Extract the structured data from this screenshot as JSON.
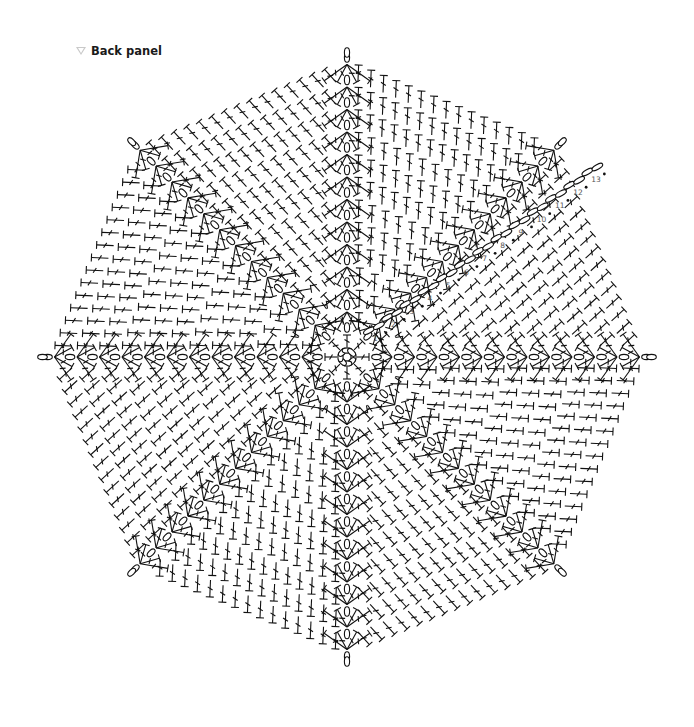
{
  "title": {
    "icon": "triangle-down-icon",
    "text": "Back panel"
  },
  "diagram": {
    "type": "crochet-chart",
    "shape": "octagon",
    "center": [
      347,
      357
    ],
    "rounds": 13,
    "spokes": 8,
    "round_spacing": 22.5,
    "row_labels": [
      "1",
      "2",
      "3",
      "4",
      "5",
      "6",
      "7",
      "8",
      "9",
      "10",
      "11",
      "12",
      "13"
    ],
    "row_label_direction_deg": -36,
    "colors": {
      "stitch": "#111111",
      "label": "#555555",
      "background": "#ffffff",
      "title_icon": "#c9c9c9"
    },
    "legend": {
      "chain": "oval",
      "double_crochet": "T-bar with cross tick",
      "slip_stitch": "dot",
      "magic_ring": "circle"
    }
  }
}
